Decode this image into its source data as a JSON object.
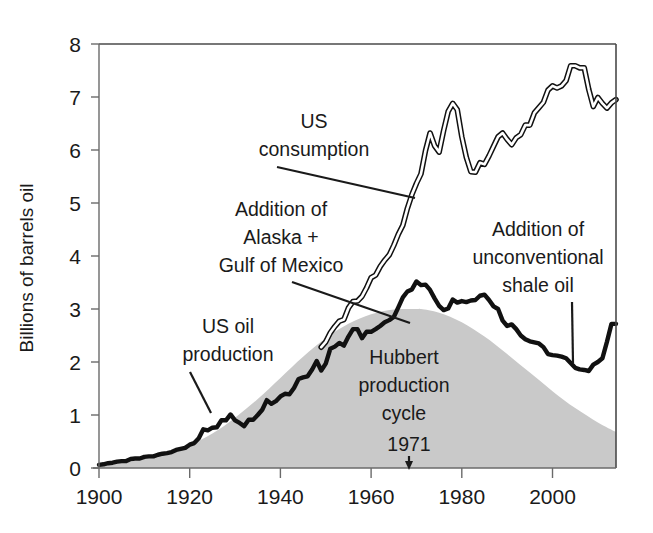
{
  "chart_data": {
    "type": "line",
    "title": "",
    "xlabel": "",
    "ylabel": "Billions of barrels oil",
    "xlim": [
      1900,
      2014
    ],
    "ylim": [
      0,
      8
    ],
    "grid": false,
    "legend": "none",
    "xticks": [
      1900,
      1920,
      1940,
      1960,
      1980,
      2000
    ],
    "yticks": [
      0,
      1,
      2,
      3,
      4,
      5,
      6,
      7,
      8
    ],
    "annotations": [
      {
        "id": "us-oil-production",
        "text": "US oil\nproduction",
        "line1": "US oil",
        "line2": "production",
        "x": 1925,
        "y": 2.5
      },
      {
        "id": "us-consumption",
        "text": "US\nconsumption",
        "line1": "US",
        "line2": "consumption",
        "x": 1956,
        "y": 6.4
      },
      {
        "id": "addition-alaska-gom",
        "line1": "Addition of",
        "line2": "Alaska +",
        "line3": "Gulf of Mexico",
        "x": 1938,
        "y": 4.6
      },
      {
        "id": "addition-shale",
        "line1": "Addition of",
        "line2": "unconventional",
        "line3": "shale oil",
        "x": 1990,
        "y": 4.4
      },
      {
        "id": "hubbert-cycle",
        "line1": "Hubbert",
        "line2": "production",
        "line3": "cycle",
        "x": 1973,
        "y": 2.3
      },
      {
        "id": "peak-year",
        "text": "1971",
        "x": 1971,
        "y": 0.55
      }
    ],
    "series": [
      {
        "name": "US oil production",
        "style": "solid-thick-black",
        "color": "#111111",
        "x": [
          1900,
          1901,
          1902,
          1903,
          1904,
          1905,
          1906,
          1907,
          1908,
          1909,
          1910,
          1911,
          1912,
          1913,
          1914,
          1915,
          1916,
          1917,
          1918,
          1919,
          1920,
          1921,
          1922,
          1923,
          1924,
          1925,
          1926,
          1927,
          1928,
          1929,
          1930,
          1931,
          1932,
          1933,
          1934,
          1935,
          1936,
          1937,
          1938,
          1939,
          1940,
          1941,
          1942,
          1943,
          1944,
          1945,
          1946,
          1947,
          1948,
          1949,
          1950,
          1951,
          1952,
          1953,
          1954,
          1955,
          1956,
          1957,
          1958,
          1959,
          1960,
          1961,
          1962,
          1963,
          1964,
          1965,
          1966,
          1967,
          1968,
          1969,
          1970,
          1971,
          1972,
          1973,
          1974,
          1975,
          1976,
          1977,
          1978,
          1979,
          1980,
          1981,
          1982,
          1983,
          1984,
          1985,
          1986,
          1987,
          1988,
          1989,
          1990,
          1991,
          1992,
          1993,
          1994,
          1995,
          1996,
          1997,
          1998,
          1999,
          2000,
          2001,
          2002,
          2003,
          2004,
          2005,
          2006,
          2007,
          2008,
          2009,
          2010,
          2011,
          2012,
          2013,
          2014
        ],
        "values": [
          0.06,
          0.07,
          0.09,
          0.1,
          0.12,
          0.13,
          0.13,
          0.17,
          0.18,
          0.18,
          0.21,
          0.22,
          0.22,
          0.25,
          0.27,
          0.28,
          0.3,
          0.34,
          0.36,
          0.38,
          0.44,
          0.47,
          0.56,
          0.73,
          0.71,
          0.76,
          0.77,
          0.9,
          0.9,
          1.01,
          0.9,
          0.85,
          0.79,
          0.91,
          0.91,
          1.0,
          1.1,
          1.28,
          1.21,
          1.26,
          1.35,
          1.4,
          1.39,
          1.51,
          1.68,
          1.71,
          1.73,
          1.86,
          2.02,
          1.84,
          1.97,
          2.25,
          2.29,
          2.36,
          2.31,
          2.48,
          2.62,
          2.62,
          2.45,
          2.57,
          2.57,
          2.62,
          2.68,
          2.75,
          2.79,
          2.85,
          3.03,
          3.22,
          3.33,
          3.37,
          3.52,
          3.45,
          3.46,
          3.36,
          3.2,
          3.06,
          2.98,
          3.01,
          3.18,
          3.12,
          3.15,
          3.13,
          3.16,
          3.17,
          3.25,
          3.27,
          3.17,
          3.05,
          3.0,
          2.78,
          2.68,
          2.71,
          2.62,
          2.5,
          2.43,
          2.39,
          2.37,
          2.35,
          2.28,
          2.15,
          2.13,
          2.12,
          2.1,
          2.07,
          1.98,
          1.89,
          1.86,
          1.85,
          1.83,
          1.95,
          2.0,
          2.07,
          2.38,
          2.72,
          2.72
        ]
      },
      {
        "name": "US consumption",
        "style": "outlined-double-line",
        "color": "#111111",
        "x": [
          1949,
          1950,
          1951,
          1952,
          1953,
          1954,
          1955,
          1956,
          1957,
          1958,
          1959,
          1960,
          1961,
          1962,
          1963,
          1964,
          1965,
          1966,
          1967,
          1968,
          1969,
          1970,
          1971,
          1972,
          1973,
          1974,
          1975,
          1976,
          1977,
          1978,
          1979,
          1980,
          1981,
          1982,
          1983,
          1984,
          1985,
          1986,
          1987,
          1988,
          1989,
          1990,
          1991,
          1992,
          1993,
          1994,
          1995,
          1996,
          1997,
          1998,
          1999,
          2000,
          2001,
          2002,
          2003,
          2004,
          2005,
          2006,
          2007,
          2008,
          2009,
          2010,
          2011,
          2012,
          2013,
          2014
        ],
        "values": [
          2.28,
          2.38,
          2.55,
          2.67,
          2.77,
          2.8,
          3.02,
          3.14,
          3.15,
          3.24,
          3.4,
          3.59,
          3.64,
          3.8,
          3.92,
          4.02,
          4.2,
          4.41,
          4.58,
          4.9,
          5.16,
          5.37,
          5.55,
          5.99,
          6.32,
          6.08,
          5.96,
          6.37,
          6.73,
          6.88,
          6.76,
          6.25,
          5.86,
          5.59,
          5.58,
          5.76,
          5.73,
          5.89,
          6.07,
          6.25,
          6.32,
          6.2,
          6.1,
          6.23,
          6.29,
          6.47,
          6.47,
          6.7,
          6.8,
          6.9,
          7.13,
          7.21,
          7.17,
          7.21,
          7.31,
          7.59,
          7.59,
          7.55,
          7.55,
          7.14,
          6.82,
          6.99,
          6.88,
          6.79,
          6.89,
          6.95
        ]
      },
      {
        "name": "Hubbert production cycle",
        "style": "filled-area-gray",
        "color": "#c9c9c9",
        "peak_year": 1971,
        "peak_value": 3.0,
        "x": [
          1900,
          1905,
          1910,
          1915,
          1920,
          1925,
          1930,
          1935,
          1940,
          1945,
          1950,
          1955,
          1960,
          1965,
          1970,
          1971,
          1975,
          1980,
          1985,
          1990,
          1995,
          2000,
          2005,
          2010,
          2014
        ],
        "values": [
          0.06,
          0.1,
          0.17,
          0.27,
          0.43,
          0.65,
          0.95,
          1.3,
          1.7,
          2.1,
          2.45,
          2.72,
          2.9,
          2.99,
          3.0,
          3.0,
          2.93,
          2.75,
          2.48,
          2.15,
          1.8,
          1.45,
          1.13,
          0.86,
          0.68
        ]
      }
    ]
  },
  "axis": {
    "y_title": "Billions of barrels oil",
    "y_ticks": [
      "0",
      "1",
      "2",
      "3",
      "4",
      "5",
      "6",
      "7",
      "8"
    ],
    "x_ticks": [
      "1900",
      "1920",
      "1940",
      "1960",
      "1980",
      "2000"
    ]
  },
  "labels": {
    "us_oil_production_l1": "US oil",
    "us_oil_production_l2": "production",
    "us_consumption_l1": "US",
    "us_consumption_l2": "consumption",
    "alaska_l1": "Addition of",
    "alaska_l2": "Alaska +",
    "alaska_l3": "Gulf of Mexico",
    "shale_l1": "Addition of",
    "shale_l2": "unconventional",
    "shale_l3": "shale oil",
    "hubbert_l1": "Hubbert",
    "hubbert_l2": "production",
    "hubbert_l3": "cycle",
    "peak_year": "1971"
  },
  "colors": {
    "background": "#ffffff",
    "axis": "#555555",
    "frame": "#444444",
    "production_line": "#111111",
    "consumption_line": "#111111",
    "hubbert_fill": "#c9c9c9",
    "text": "#1a1a1a"
  }
}
